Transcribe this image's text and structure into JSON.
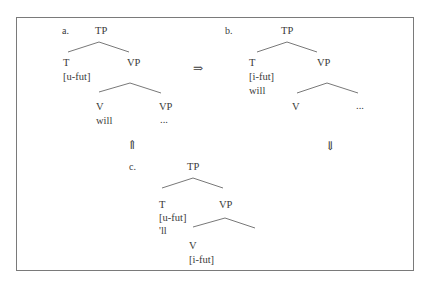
{
  "diagram": {
    "type": "syntax-tree-derivation",
    "trees": {
      "a": {
        "label": "a.",
        "root": "TP",
        "t_node": "T",
        "t_feature": "[u-fut]",
        "vp_node": "VP",
        "v_node": "V",
        "v_word": "will",
        "inner_vp": "VP",
        "inner_vp_content": "..."
      },
      "b": {
        "label": "b.",
        "root": "TP",
        "t_node": "T",
        "t_feature": "[i-fut]",
        "t_word": "will",
        "vp_node": "VP",
        "v_node": "V",
        "vp_content": "..."
      },
      "c": {
        "label": "c.",
        "root": "TP",
        "t_node": "T",
        "t_feature": "[u-fut]",
        "t_word": "'ll",
        "vp_node": "VP",
        "v_node": "V",
        "v_feature": "[i-fut]"
      }
    },
    "arrows": {
      "a_to_b": "⇒",
      "b_down": "⇓",
      "c_up": "⇑"
    }
  }
}
